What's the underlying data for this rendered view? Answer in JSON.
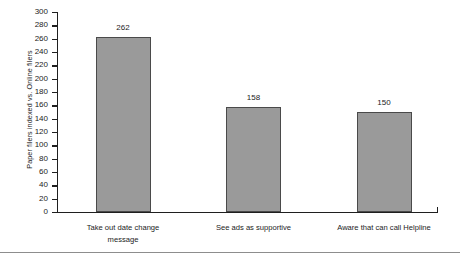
{
  "chart_data": {
    "type": "bar",
    "title": "",
    "xlabel": "",
    "ylabel": "Paper filers indexed vs. Online filers",
    "ylim": [
      0,
      300
    ],
    "ytick_step": 20,
    "yticks": [
      300,
      280,
      260,
      240,
      220,
      200,
      180,
      160,
      140,
      120,
      100,
      80,
      60,
      40,
      20,
      0
    ],
    "grid": false,
    "legend": "none",
    "bar_color": "#9a9a9a",
    "bar_border_color": "#4a4a4a",
    "axis_color": "#1f1f1f",
    "categories": [
      "Take out date change message",
      "See ads as supportive",
      "Aware that can call Helpline"
    ],
    "category_lines": [
      [
        "Take out date change",
        "message"
      ],
      [
        "See ads as supportive"
      ],
      [
        "Aware that can call Helpline"
      ]
    ],
    "values": [
      262,
      158,
      150
    ],
    "value_labels": [
      "262",
      "158",
      "150"
    ]
  }
}
